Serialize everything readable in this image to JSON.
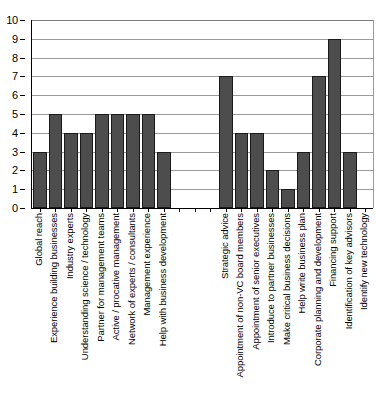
{
  "chart_data": {
    "type": "bar",
    "title": "",
    "subtitle": "",
    "xlabel": "",
    "ylabel": "",
    "ylim": [
      0,
      10
    ],
    "ytick_labels": [
      "0",
      "1",
      "2",
      "3",
      "4",
      "5",
      "6",
      "7",
      "8",
      "9",
      "10"
    ],
    "ytick_values": [
      0,
      1,
      2,
      3,
      4,
      5,
      6,
      7,
      8,
      9,
      10
    ],
    "grid": "horizontal",
    "legend": "none",
    "bar_color": "#4d4d4d",
    "bar_edge_color": "#1a1a1a",
    "gridline_color": "#9a9a9a",
    "axis_color": "#000000",
    "background": "#ffffff",
    "categories": [
      "Global reach",
      "Experience building businesses",
      "Industry experts",
      "Understanding science / technology",
      "Partner for management teams",
      "Active / procative management",
      "Network of experts / consultants",
      "Management experience",
      "Help with business development",
      "",
      "",
      "",
      "Strategic advice",
      "Appointment of non-VC board members",
      "Appointment of senior executives",
      "Introduce to partner businesses",
      "Make critical business decisions",
      "Help write business plan",
      "Corporate planning and development",
      "Financing support",
      "Identification of key advisors",
      "Identify new technology"
    ],
    "values": [
      3,
      5,
      4,
      4,
      5,
      5,
      5,
      5,
      3,
      0,
      0,
      0,
      7,
      4,
      4,
      2,
      1,
      3,
      7,
      9,
      3,
      0
    ]
  }
}
